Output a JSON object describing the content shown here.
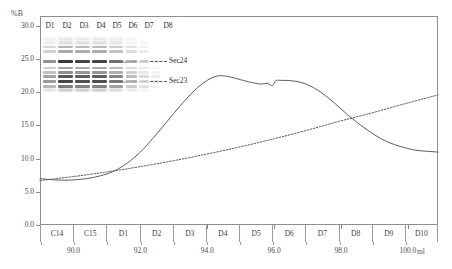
{
  "axes": {
    "y_title": "%B",
    "x_unit": "ml",
    "y_ticks": [
      "30.0",
      "25.0",
      "20.0",
      "15.0",
      "10.0",
      "5.0",
      "0.0"
    ],
    "y_values": [
      30.0,
      25.0,
      20.0,
      15.0,
      10.0,
      5.0,
      0.0
    ],
    "x_ticks": [
      "90.0",
      "92.0",
      "94.0",
      "96.0",
      "98.0",
      "100.0"
    ],
    "x_values": [
      90.0,
      92.0,
      94.0,
      96.0,
      98.0,
      100.0
    ]
  },
  "fractions": [
    "C14",
    "C15",
    "D1",
    "D2",
    "D3",
    "D4",
    "D5",
    "D6",
    "D7",
    "D8",
    "D9",
    "D10"
  ],
  "gel": {
    "lanes": [
      "D1",
      "D2",
      "D3",
      "D4",
      "D5",
      "D6",
      "D7",
      "D8"
    ],
    "annotations": [
      "Sec24",
      "Sec23"
    ]
  },
  "chart_data": {
    "type": "line",
    "title": "",
    "xlabel": "ml",
    "ylabel": "%B",
    "xlim": [
      89.0,
      100.9
    ],
    "ylim": [
      0.0,
      31.5
    ],
    "grid": false,
    "legend": "none",
    "series": [
      {
        "name": "UV absorbance trace",
        "style": "solid",
        "color": "#4a4a4a",
        "x": [
          89.0,
          89.3,
          89.7,
          90.0,
          90.4,
          90.8,
          91.2,
          91.6,
          92.0,
          92.4,
          92.8,
          93.2,
          93.6,
          94.0,
          94.3,
          94.6,
          95.0,
          95.3,
          95.6,
          95.8,
          95.95,
          96.05,
          96.2,
          96.5,
          96.8,
          97.1,
          97.4,
          97.8,
          98.2,
          98.6,
          99.0,
          99.4,
          99.8,
          100.2,
          100.6,
          100.9
        ],
        "y": [
          7.0,
          6.85,
          6.75,
          6.8,
          7.0,
          7.4,
          8.1,
          9.3,
          11.0,
          13.2,
          15.6,
          18.0,
          20.2,
          21.8,
          22.45,
          22.4,
          21.9,
          21.5,
          21.25,
          21.35,
          21.0,
          21.75,
          21.8,
          21.75,
          21.5,
          20.9,
          20.0,
          18.4,
          16.6,
          15.0,
          13.6,
          12.5,
          11.8,
          11.3,
          11.1,
          11.0
        ]
      },
      {
        "name": "Gradient %B",
        "style": "dotted",
        "color": "#555555",
        "x": [
          89.0,
          90.0,
          91.0,
          92.0,
          93.0,
          94.0,
          95.0,
          96.0,
          97.0,
          98.0,
          99.0,
          100.0,
          100.9
        ],
        "y": [
          6.7,
          7.3,
          8.0,
          8.8,
          9.7,
          10.7,
          11.8,
          13.0,
          14.3,
          15.7,
          17.0,
          18.4,
          19.6
        ]
      }
    ]
  }
}
